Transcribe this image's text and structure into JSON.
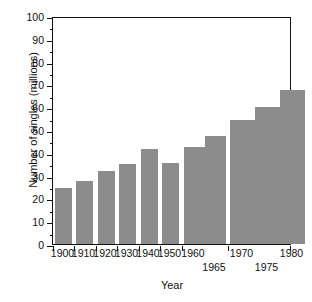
{
  "chart_data": {
    "type": "bar",
    "title": "",
    "xlabel": "Year",
    "ylabel": "Number of singles (millions)",
    "categories": [
      "1900",
      "1910",
      "1920",
      "1930",
      "1940",
      "1950",
      "1960",
      "1965",
      "1970",
      "1975",
      "1980"
    ],
    "values": [
      24.5,
      27.5,
      32.0,
      35.0,
      41.5,
      35.5,
      42.5,
      47.5,
      54.5,
      60.0,
      67.5
    ],
    "ylim": [
      0,
      100
    ],
    "xlim_note": "irregular category spacing; 1900-1950 decade bars narrow, 1960/1965 paired wider, 1970/1975/1980 widest",
    "ytick_major": [
      0,
      10,
      20,
      30,
      40,
      50,
      60,
      70,
      80,
      90,
      100
    ],
    "ytick_minor": [
      5,
      15,
      25,
      35,
      45,
      55,
      65,
      75,
      85,
      95
    ],
    "ytick_labels": [
      "0",
      "10",
      "20",
      "30",
      "40",
      "50",
      "60",
      "70",
      "80",
      "90",
      "100"
    ],
    "grid": false,
    "legend": null,
    "legend_position": "none",
    "bar_color": "#8c8c8c",
    "axis_color": "#111111",
    "background_color": "#ffffff",
    "bars": [
      {
        "label": "1900",
        "value": 24.5,
        "x": 2.0,
        "width": 17.0,
        "label_row": 1,
        "label_center": 10.5
      },
      {
        "label": "1910",
        "value": 27.5,
        "x": 23.0,
        "width": 17.0,
        "label_row": 1,
        "label_center": 31.5
      },
      {
        "label": "1920",
        "value": 32.0,
        "x": 44.5,
        "width": 17.0,
        "label_row": 1,
        "label_center": 53.0
      },
      {
        "label": "1930",
        "value": 35.0,
        "x": 66.0,
        "width": 17.0,
        "label_row": 1,
        "label_center": 74.5
      },
      {
        "label": "1940",
        "value": 41.5,
        "x": 87.5,
        "width": 17.0,
        "label_row": 1,
        "label_center": 96.0
      },
      {
        "label": "1950",
        "value": 35.5,
        "x": 109.0,
        "width": 17.0,
        "label_row": 1,
        "label_center": 117.5
      },
      {
        "label": "1960",
        "value": 42.5,
        "x": 130.5,
        "width": 21.0,
        "label_row": 1,
        "label_center": 141.0
      },
      {
        "label": "1965",
        "value": 47.5,
        "x": 151.5,
        "width": 21.0,
        "label_row": 2,
        "label_center": 162.0
      },
      {
        "label": "1970",
        "value": 54.5,
        "x": 177.0,
        "width": 25.0,
        "label_row": 1,
        "label_center": 189.5
      },
      {
        "label": "1975",
        "value": 60.0,
        "x": 202.0,
        "width": 25.0,
        "label_row": 2,
        "label_center": 214.5
      },
      {
        "label": "1980",
        "value": 67.5,
        "x": 227.0,
        "width": 25.0,
        "label_row": 1,
        "label_center": 239.5
      }
    ],
    "xtick_positions": [
      0,
      21.0,
      42.5,
      64.0,
      85.5,
      107.0,
      128.5,
      174.5,
      237.0
    ]
  }
}
